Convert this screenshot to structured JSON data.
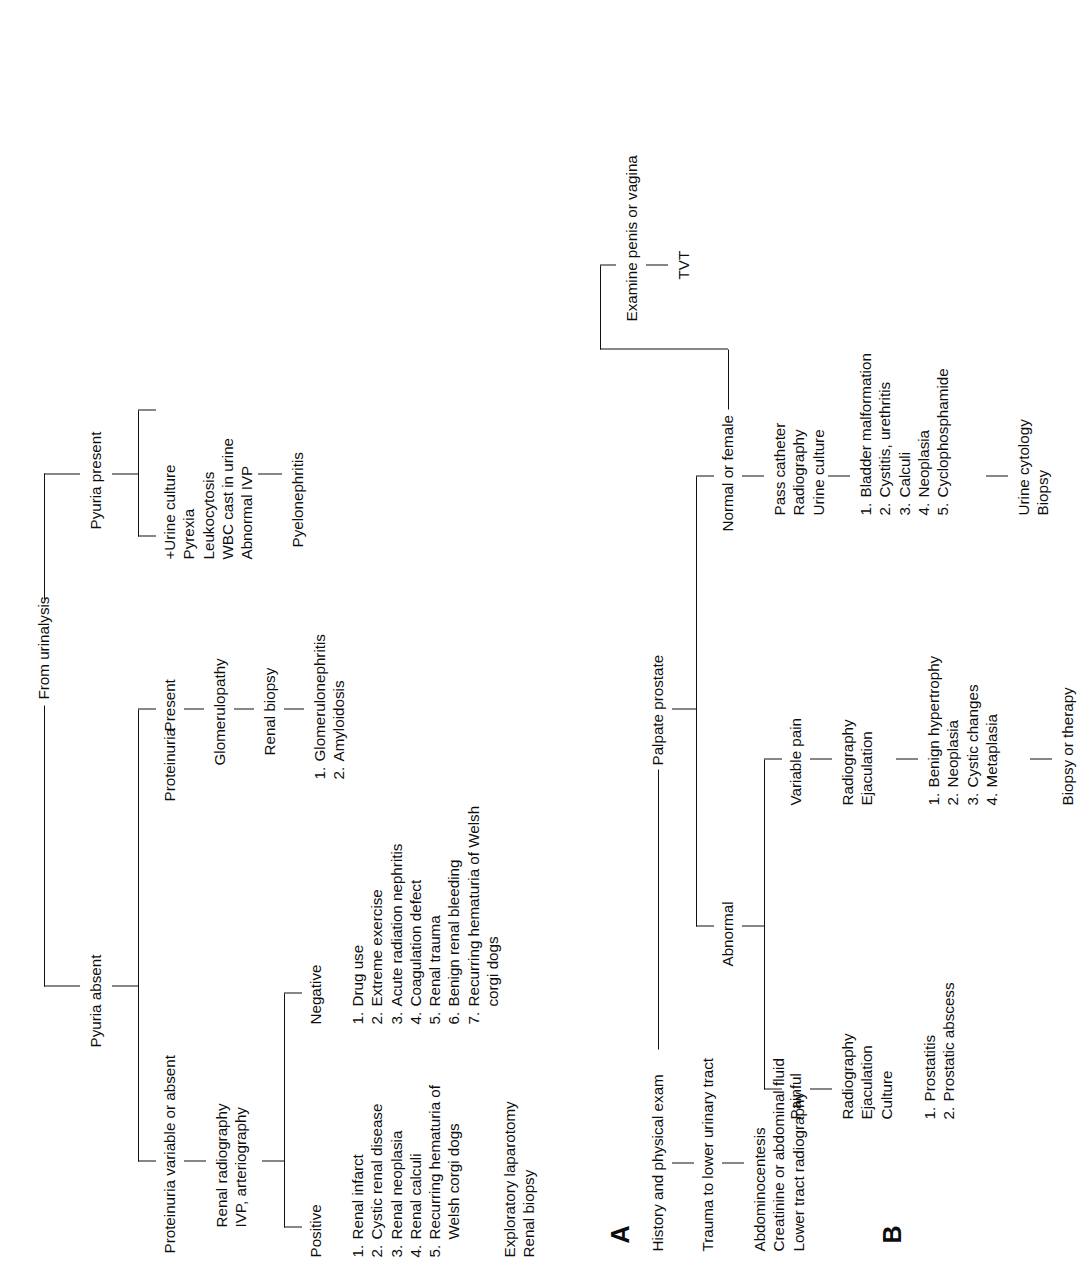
{
  "figure": {
    "panel_a_letter": "A",
    "panel_b_letter": "B"
  },
  "chart_a": {
    "root": "From urinalysis",
    "branch_left": "Pyuria absent",
    "branch_right": "Pyuria present",
    "pyuria_present": {
      "findings": [
        "+Urine culture",
        "Pyrexia",
        "Leukocytosis",
        "WBC cast in urine",
        "Abnormal IVP"
      ],
      "diagnosis": "Pyelonephritis"
    },
    "proteinuria_present": {
      "label_a": "Proteinuria",
      "label_b": "Present",
      "result": "Glomerulopathy",
      "test": "Renal biopsy",
      "list": [
        "Glomerulonephritis",
        "Amyloidosis"
      ]
    },
    "proteinuria_variable": {
      "label": "Proteinuria variable or absent",
      "tests": [
        "Renal radiography",
        "IVP, arteriography"
      ],
      "positive_label": "Positive",
      "negative_label": "Negative",
      "positive_list": [
        "Renal infarct",
        "Cystic renal disease",
        "Renal neoplasia",
        "Renal calculi",
        "Recurring hematuria of"
      ],
      "positive_list_cont": "Welsh corgi dogs",
      "positive_followup": [
        "Exploratory laparotomy",
        "Renal biopsy"
      ],
      "negative_list": [
        "Drug use",
        "Extreme exercise",
        "Acute radiation nephritis",
        "Coagulation defect",
        "Renal trauma",
        "Benign renal bleeding",
        "Recurring hematuria of Welsh"
      ],
      "negative_list_cont": "corgi dogs"
    }
  },
  "chart_b": {
    "root": "History and physical exam",
    "step2": "Trauma to lower urinary tract",
    "step2_tests": [
      "Abdominocentesis",
      "Creatinine or abdominal fluid",
      "Lower tract radiography"
    ],
    "palpate": "Palpate prostate",
    "abnormal_label": "Abnormal",
    "normal_label": "Normal or female",
    "painful": {
      "label": "Painful",
      "tests": [
        "Radiography",
        "Ejaculation",
        "Culture"
      ],
      "list": [
        "Prostatitis",
        "Prostatic abscess"
      ]
    },
    "variable_pain": {
      "label": "Variable pain",
      "tests": [
        "Radiography",
        "Ejaculation"
      ],
      "list": [
        "Benign hypertrophy",
        "Neoplasia",
        "Cystic changes",
        "Metaplasia"
      ],
      "followup": "Biopsy or therapy"
    },
    "normal_or_female": {
      "label": "Normal or female",
      "tests": [
        "Pass catheter",
        "Radiography",
        "Urine culture"
      ],
      "list": [
        "Bladder malformation",
        "Cystitis, urethritis",
        "Calculi",
        "Neoplasia",
        "Cyclophosphamide"
      ],
      "followup": [
        "Urine cytology",
        "Biopsy"
      ]
    },
    "examine": {
      "label": "Examine penis or vagina",
      "result": "TVT"
    }
  }
}
